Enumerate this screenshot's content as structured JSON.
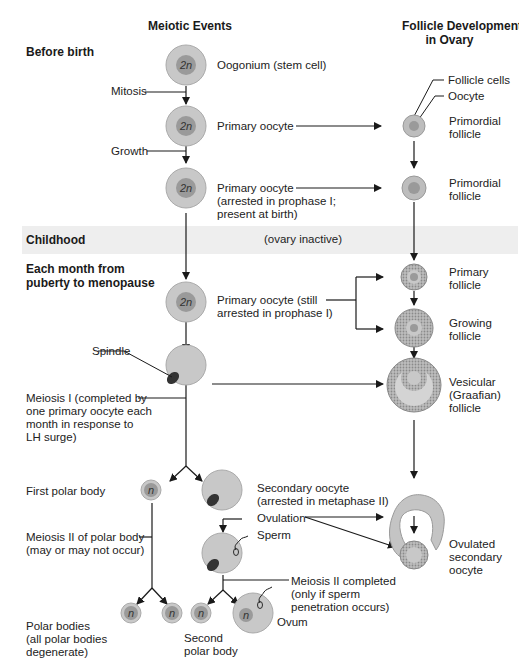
{
  "headers": {
    "meiotic_events": "Meiotic Events",
    "follicle_development": "Follicle Development\nin Ovary"
  },
  "phases": {
    "before_birth": "Before birth",
    "childhood": "Childhood",
    "childhood_note": "(ovary inactive)",
    "each_month": "Each month from\npuberty to menopause"
  },
  "labels": {
    "oogonium": "Oogonium (stem cell)",
    "mitosis": "Mitosis",
    "primary_oocyte": "Primary oocyte",
    "growth": "Growth",
    "primary_oocyte_arrested": "Primary oocyte\n(arrested in prophase I;\npresent at birth)",
    "primary_oocyte_still": "Primary oocyte (still\narrested in prophase I)",
    "spindle": "Spindle",
    "meiosis_i": "Meiosis I (completed by\none primary oocyte each\nmonth in response to\nLH surge)",
    "first_polar_body": "First polar body",
    "secondary_oocyte": "Secondary oocyte\n(arrested in metaphase II)",
    "ovulation": "Ovulation",
    "sperm": "Sperm",
    "meiosis_ii_polar": "Meiosis II of polar body\n(may or may not occur)",
    "meiosis_ii_completed": "Meiosis II completed\n(only if sperm\npenetration occurs)",
    "ovum": "Ovum",
    "polar_bodies": "Polar bodies\n(all polar bodies\ndegenerate)",
    "second_polar_body": "Second\npolar body"
  },
  "follicle_labels": {
    "follicle_cells": "Follicle cells",
    "oocyte": "Oocyte",
    "primordial_1": "Primordial\nfollicle",
    "primordial_2": "Primordial\nfollicle",
    "primary": "Primary\nfollicle",
    "growing": "Growing\nfollicle",
    "vesicular": "Vesicular\n(Graafian)\nfollicle",
    "ovulated": "Ovulated\nsecondary\noocyte"
  },
  "cell_labels": {
    "diploid": "2n",
    "haploid": "n"
  },
  "colors": {
    "cell_outer": "#c8c8c8",
    "cell_inner": "#9a9a9a",
    "band": "#eeeeee",
    "line": "#1a1a1a"
  }
}
